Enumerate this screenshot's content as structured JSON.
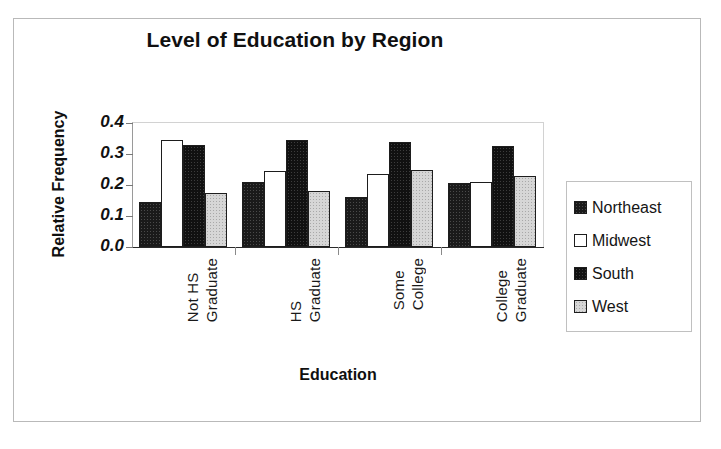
{
  "chart_data": {
    "type": "bar",
    "title": "Level of Education by Region",
    "xlabel": "Education",
    "ylabel": "Relative Frequency",
    "ylim": [
      0.0,
      0.4
    ],
    "yticks": [
      "0.0",
      "0.1",
      "0.2",
      "0.3",
      "0.4"
    ],
    "ytick_values": [
      0.0,
      0.1,
      0.2,
      0.3,
      0.4
    ],
    "grid": false,
    "legend_position": "right",
    "categories": [
      "Not HS Graduate",
      "HS Graduate",
      "Some College",
      "College Graduate"
    ],
    "category_lines": [
      [
        "Not HS",
        "Graduate"
      ],
      [
        "HS",
        "Graduate"
      ],
      [
        "Some",
        "College"
      ],
      [
        "College",
        "Graduate"
      ]
    ],
    "series": [
      {
        "name": "Northeast",
        "color": "#1a1a1a",
        "values": [
          0.145,
          0.21,
          0.16,
          0.205
        ]
      },
      {
        "name": "Midwest",
        "color": "#ffffff",
        "values": [
          0.345,
          0.245,
          0.235,
          0.21
        ]
      },
      {
        "name": "South",
        "color": "#111111",
        "values": [
          0.33,
          0.345,
          0.34,
          0.325
        ]
      },
      {
        "name": "West",
        "color": "#d6d6d6",
        "values": [
          0.175,
          0.18,
          0.25,
          0.23
        ]
      }
    ]
  },
  "legend": {
    "items": [
      {
        "label": "Northeast"
      },
      {
        "label": "Midwest"
      },
      {
        "label": "South"
      },
      {
        "label": "West"
      }
    ]
  }
}
